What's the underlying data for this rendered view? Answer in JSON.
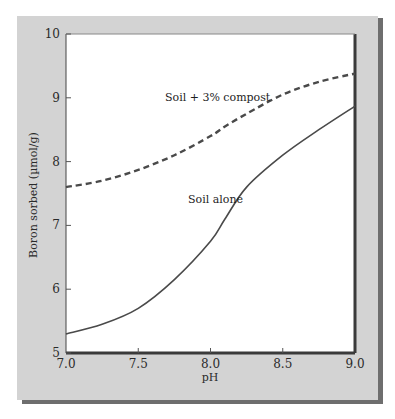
{
  "chart_data": {
    "type": "line",
    "title": "",
    "xlabel": "pH",
    "ylabel": "Boron sorbed (µmol/g)",
    "xlim": [
      7.0,
      9.0
    ],
    "ylim": [
      5,
      10
    ],
    "x_ticks": [
      "7.0",
      "7.5",
      "8.0",
      "8.5",
      "9.0"
    ],
    "y_ticks": [
      "5",
      "6",
      "7",
      "8",
      "9",
      "10"
    ],
    "grid": false,
    "legend": "inline labels",
    "x": [
      7.0,
      7.25,
      7.5,
      7.75,
      8.0,
      8.1,
      8.25,
      8.5,
      8.75,
      9.0
    ],
    "series": [
      {
        "name": "Soil + 3% compost",
        "style": "dashed",
        "values": [
          7.6,
          7.7,
          7.87,
          8.1,
          8.4,
          8.55,
          8.75,
          9.05,
          9.25,
          9.38
        ]
      },
      {
        "name": "Soil alone",
        "style": "solid",
        "values": [
          5.3,
          5.45,
          5.7,
          6.15,
          6.75,
          7.1,
          7.6,
          8.1,
          8.5,
          8.87
        ]
      }
    ]
  },
  "colors": {
    "panel": "#d3d3d3",
    "plot": "#ffffff",
    "line": "#4a4a4a"
  }
}
